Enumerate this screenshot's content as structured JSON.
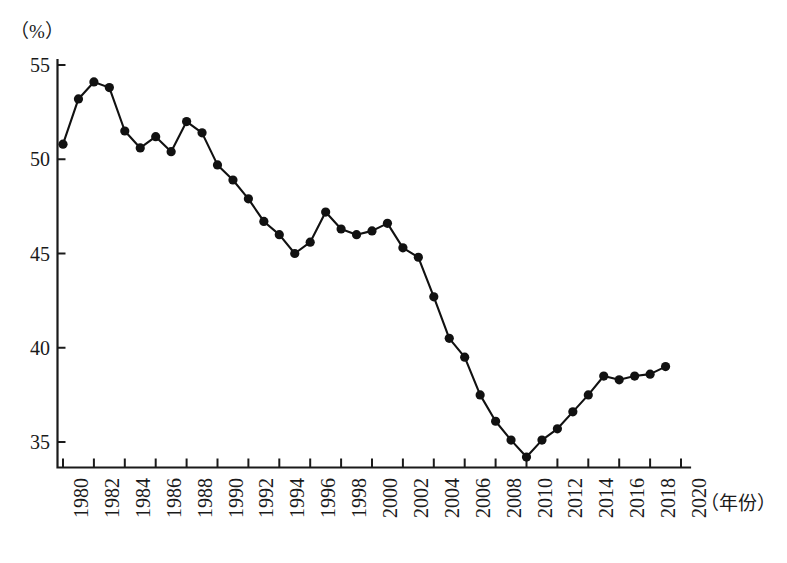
{
  "chart_data": {
    "type": "line",
    "title": "",
    "subtitle": "",
    "xlabel": "（年份）",
    "ylabel": "（%）",
    "unit_label": "（%）",
    "xlim": [
      1980,
      2020
    ],
    "ylim": [
      33.5,
      55.8
    ],
    "yticks": [
      35,
      40,
      45,
      50,
      55
    ],
    "ytick_labels": [
      "35",
      "40",
      "45",
      "50",
      "55"
    ],
    "xticks": [
      1980,
      1982,
      1984,
      1986,
      1988,
      1990,
      1992,
      1994,
      1996,
      1998,
      2000,
      2002,
      2004,
      2006,
      2008,
      2010,
      2012,
      2014,
      2016,
      2018,
      2020
    ],
    "xtick_labels": [
      "1980",
      "1982",
      "1984",
      "1986",
      "1988",
      "1990",
      "1992",
      "1994",
      "1996",
      "1998",
      "2000",
      "2002",
      "2004",
      "2006",
      "2008",
      "2010",
      "2012",
      "2014",
      "2016",
      "2018",
      "2020"
    ],
    "grid": false,
    "legend": false,
    "legend_position": "none",
    "marker": "filled-circle",
    "x": [
      1980,
      1981,
      1982,
      1983,
      1984,
      1985,
      1986,
      1987,
      1988,
      1989,
      1990,
      1991,
      1992,
      1993,
      1994,
      1995,
      1996,
      1997,
      1998,
      1999,
      2000,
      2001,
      2002,
      2003,
      2004,
      2005,
      2006,
      2007,
      2008,
      2009,
      2010,
      2011,
      2012,
      2013,
      2014,
      2015,
      2016,
      2017,
      2018,
      2019
    ],
    "series": [
      {
        "name": "",
        "values": [
          50.8,
          53.2,
          54.1,
          53.8,
          51.5,
          50.6,
          51.2,
          50.4,
          52.0,
          51.4,
          49.7,
          48.9,
          47.9,
          46.7,
          46.0,
          45.0,
          45.6,
          47.2,
          46.3,
          46.0,
          46.2,
          46.6,
          45.3,
          44.8,
          42.7,
          40.5,
          39.5,
          37.5,
          36.1,
          35.1,
          34.2,
          35.1,
          35.7,
          36.6,
          37.5,
          38.5,
          38.3,
          38.5,
          38.6,
          39.0
        ]
      }
    ]
  },
  "axis": {
    "unit_label": "（%）",
    "x_axis_name": "（年份）"
  },
  "caption": {
    "text": ""
  }
}
